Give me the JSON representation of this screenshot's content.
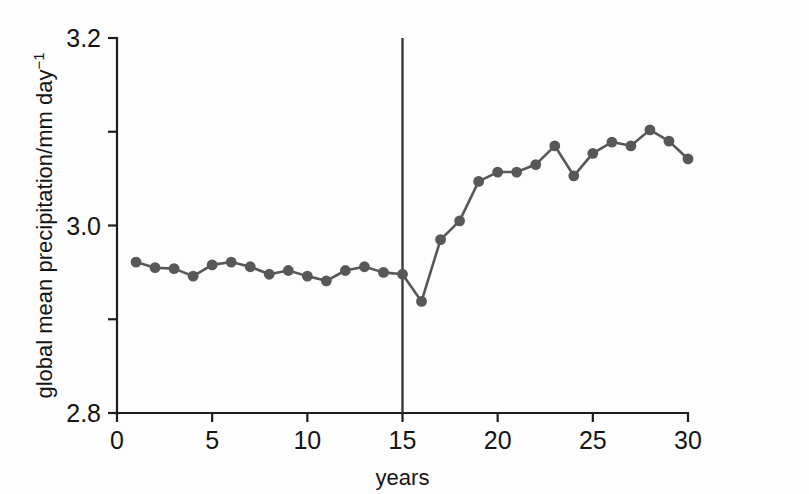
{
  "figure": {
    "background_color": "#fdfdfd",
    "axis_color": "#1d1d1d",
    "series_color": "#585858",
    "intervention_color": "#3a3a3a"
  },
  "axis": {
    "y_title_main": "global mean precipitation/mm day",
    "y_title_exponent": "−1",
    "x_title": "years",
    "y_ticks": [
      "3.2",
      "3.0",
      "2.8"
    ],
    "x_ticks": [
      "0",
      "5",
      "10",
      "15",
      "20",
      "25",
      "30"
    ]
  },
  "chart_data": {
    "type": "line",
    "title": "",
    "xlabel": "years",
    "ylabel": "global mean precipitation/mm day⁻¹",
    "xlim": [
      0,
      30
    ],
    "ylim": [
      2.8,
      3.2
    ],
    "grid": false,
    "legend": "none",
    "x_major_ticks": [
      0,
      5,
      10,
      15,
      20,
      25,
      30
    ],
    "y_major_ticks": [
      2.8,
      3.0,
      3.2
    ],
    "y_minor_ticks": [
      2.9,
      3.1
    ],
    "annotations": [
      {
        "name": "intervention-line",
        "type": "vline",
        "x": 15,
        "label": ""
      }
    ],
    "series": [
      {
        "name": "global mean precipitation",
        "marker": "circle",
        "x": [
          1,
          2,
          3,
          4,
          5,
          6,
          7,
          8,
          9,
          10,
          11,
          12,
          13,
          14,
          15,
          16,
          17,
          18,
          19,
          20,
          21,
          22,
          23,
          24,
          25,
          26,
          27,
          28,
          29,
          30
        ],
        "values": [
          2.961,
          2.955,
          2.954,
          2.946,
          2.958,
          2.961,
          2.956,
          2.948,
          2.952,
          2.946,
          2.941,
          2.952,
          2.956,
          2.95,
          2.948,
          2.919,
          2.985,
          3.005,
          3.047,
          3.057,
          3.057,
          3.065,
          3.085,
          3.053,
          3.077,
          3.089,
          3.085,
          3.102,
          3.09,
          3.071
        ]
      }
    ]
  }
}
